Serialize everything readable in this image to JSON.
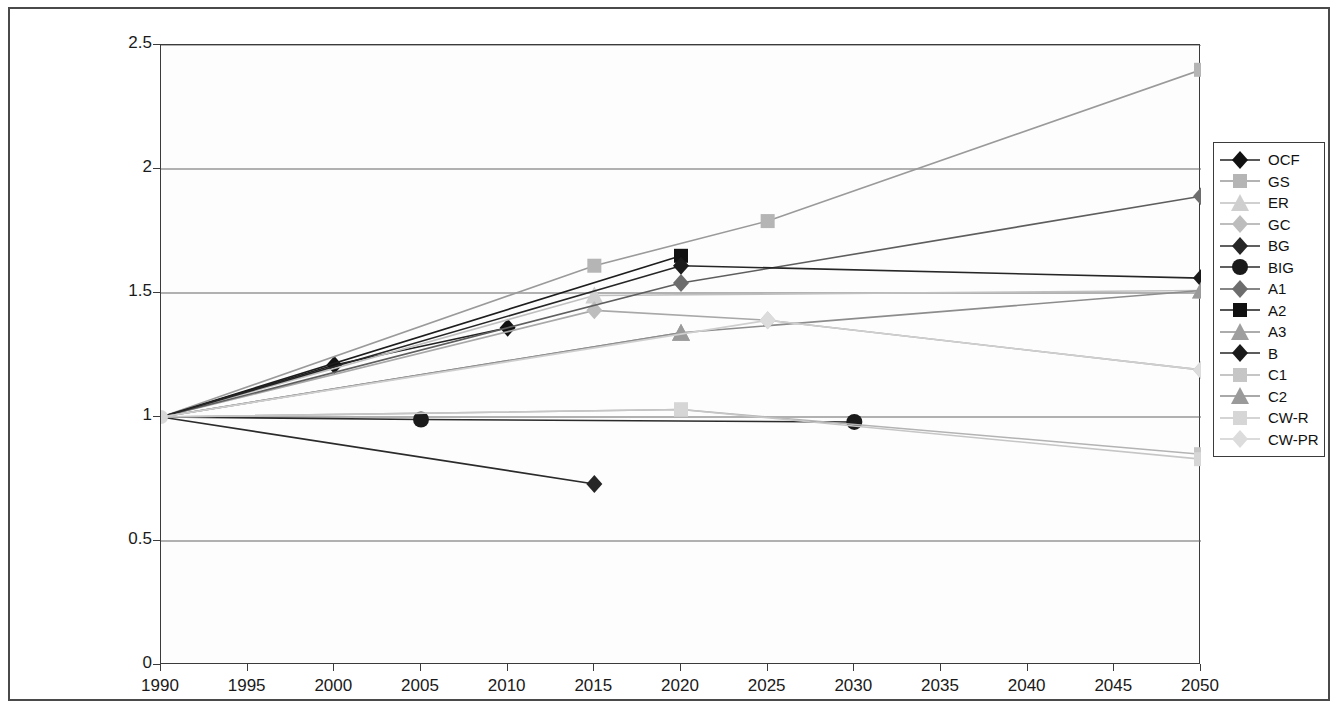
{
  "chart_data": {
    "type": "line",
    "title": "",
    "xlabel": "",
    "ylabel": "index (1990 = 1)",
    "xlim": [
      1990,
      2050
    ],
    "ylim": [
      0,
      2.5
    ],
    "xticks": [
      1990,
      1995,
      2000,
      2005,
      2010,
      2015,
      2020,
      2025,
      2030,
      2035,
      2040,
      2045,
      2050
    ],
    "yticks": [
      0,
      0.5,
      1,
      1.5,
      2,
      2.5
    ],
    "ytick_labels": [
      "0",
      "0.5",
      "1",
      "1.5",
      "2",
      "2.5"
    ],
    "xtick_labels": [
      "1990",
      "1995",
      "2000",
      "2005",
      "2010",
      "2015",
      "2020",
      "2025",
      "2030",
      "2035",
      "2040",
      "2045",
      "2050"
    ],
    "grid": "horizontal",
    "legend_position": "right",
    "series": [
      {
        "name": "OCF",
        "marker": "diamond",
        "color": "#111111",
        "line_color": "#222222",
        "x": [
          1990,
          2000,
          2010
        ],
        "values": [
          1.0,
          1.21,
          1.36
        ]
      },
      {
        "name": "GS",
        "marker": "square",
        "color": "#b5b5b5",
        "line_color": "#9a9a9a",
        "x": [
          1990,
          2015,
          2025,
          2050
        ],
        "values": [
          1.0,
          1.61,
          1.79,
          2.4
        ]
      },
      {
        "name": "ER",
        "marker": "triangle",
        "color": "#cfcfcf",
        "line_color": "#c0c0c0",
        "x": [
          1990,
          2015,
          2050
        ],
        "values": [
          1.0,
          1.49,
          1.51
        ]
      },
      {
        "name": "GC",
        "marker": "diamond",
        "color": "#bdbdbd",
        "line_color": "#a8a8a8",
        "x": [
          1990,
          2015,
          2025,
          2050
        ],
        "values": [
          1.0,
          1.43,
          1.39,
          1.19
        ]
      },
      {
        "name": "BG",
        "marker": "diamond",
        "color": "#262626",
        "line_color": "#2b2b2b",
        "x": [
          1990,
          2015
        ],
        "values": [
          1.0,
          0.73
        ]
      },
      {
        "name": "BIG",
        "marker": "circle",
        "color": "#1a1a1a",
        "line_color": "#2b2b2b",
        "x": [
          1990,
          2005,
          2030
        ],
        "values": [
          1.0,
          0.99,
          0.98
        ]
      },
      {
        "name": "A1",
        "marker": "diamond",
        "color": "#6d6d6d",
        "line_color": "#5e5e5e",
        "x": [
          1990,
          2020,
          2050
        ],
        "values": [
          1.0,
          1.54,
          1.89
        ]
      },
      {
        "name": "A2",
        "marker": "square",
        "color": "#111111",
        "line_color": "#1d1d1d",
        "x": [
          1990,
          2020
        ],
        "values": [
          1.0,
          1.65
        ]
      },
      {
        "name": "A3",
        "marker": "triangle",
        "color": "#9e9e9e",
        "line_color": "#909090",
        "x": [
          1990,
          2020
        ],
        "values": [
          1.0,
          1.34
        ]
      },
      {
        "name": "B",
        "marker": "diamond",
        "color": "#1a1a1a",
        "line_color": "#262626",
        "x": [
          1990,
          2020,
          2050
        ],
        "values": [
          1.0,
          1.61,
          1.56
        ]
      },
      {
        "name": "C1",
        "marker": "square",
        "color": "#c6c6c6",
        "line_color": "#b3b3b3",
        "x": [
          1990,
          2020,
          2050
        ],
        "values": [
          1.0,
          1.03,
          0.85
        ]
      },
      {
        "name": "C2",
        "marker": "triangle",
        "color": "#9a9a9a",
        "line_color": "#8c8c8c",
        "x": [
          1990,
          2020,
          2050
        ],
        "values": [
          1.0,
          1.34,
          1.51
        ]
      },
      {
        "name": "CW-R",
        "marker": "square",
        "color": "#d6d6d6",
        "line_color": "#c6c6c6",
        "x": [
          1990,
          2020,
          2050
        ],
        "values": [
          1.0,
          1.03,
          0.83
        ]
      },
      {
        "name": "CW-PR",
        "marker": "diamond",
        "color": "#dcdcdc",
        "line_color": "#cfcfcf",
        "x": [
          1990,
          2025,
          2050
        ],
        "values": [
          1.0,
          1.39,
          1.19
        ]
      }
    ]
  }
}
